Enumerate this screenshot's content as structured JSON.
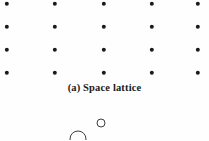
{
  "figure": {
    "panel_label": "(a)",
    "caption": "(a) Space lattice",
    "background_color": "#fefefe",
    "dot_color": "#1a1a1a",
    "outline_color": "#3d3d3d"
  },
  "lattice": {
    "columns": 5,
    "rows": 4,
    "dot_diameter_px": 4.4,
    "column_x": [
      7,
      55,
      104,
      152,
      198
    ],
    "row_y": [
      4,
      27,
      50,
      73
    ],
    "points": [
      {
        "col": 1,
        "row": 1,
        "x": 7,
        "y": 4
      },
      {
        "col": 2,
        "row": 1,
        "x": 55,
        "y": 4
      },
      {
        "col": 3,
        "row": 1,
        "x": 104,
        "y": 4
      },
      {
        "col": 4,
        "row": 1,
        "x": 152,
        "y": 4
      },
      {
        "col": 5,
        "row": 1,
        "x": 198,
        "y": 4
      },
      {
        "col": 1,
        "row": 2,
        "x": 7,
        "y": 27
      },
      {
        "col": 2,
        "row": 2,
        "x": 55,
        "y": 27
      },
      {
        "col": 3,
        "row": 2,
        "x": 104,
        "y": 27
      },
      {
        "col": 4,
        "row": 2,
        "x": 152,
        "y": 27
      },
      {
        "col": 5,
        "row": 2,
        "x": 198,
        "y": 27
      },
      {
        "col": 1,
        "row": 3,
        "x": 7,
        "y": 50
      },
      {
        "col": 2,
        "row": 3,
        "x": 55,
        "y": 50
      },
      {
        "col": 3,
        "row": 3,
        "x": 104,
        "y": 50
      },
      {
        "col": 4,
        "row": 3,
        "x": 152,
        "y": 50
      },
      {
        "col": 5,
        "row": 3,
        "x": 198,
        "y": 50
      },
      {
        "col": 1,
        "row": 4,
        "x": 7,
        "y": 73
      },
      {
        "col": 2,
        "row": 4,
        "x": 55,
        "y": 73
      },
      {
        "col": 3,
        "row": 4,
        "x": 104,
        "y": 73
      },
      {
        "col": 4,
        "row": 4,
        "x": 152,
        "y": 73
      },
      {
        "col": 5,
        "row": 4,
        "x": 198,
        "y": 73
      }
    ]
  },
  "crystal_structure": {
    "atoms": [
      {
        "name": "large-atom",
        "cx": 78,
        "cy": 139,
        "d": 17
      },
      {
        "name": "small-atom",
        "cx": 101,
        "cy": 123,
        "d": 9
      }
    ]
  }
}
